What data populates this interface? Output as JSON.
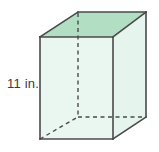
{
  "figure": {
    "name": "rectangular-prism",
    "type": "3d-solid-diagram",
    "background_color": "#ffffff",
    "colors": {
      "top_face": "#b2dfc4",
      "front_face": "#eaf6f0",
      "side_face": "#e6f4ee",
      "edge_solid": "#4a4a4a",
      "edge_hidden": "#4a4a4a",
      "label_text": "#3a3a3a"
    },
    "labels": [
      {
        "id": "height-label",
        "text": "11 in.",
        "value": 11,
        "unit": "in.",
        "measures": "height",
        "position": "left-of-front-left-edge"
      }
    ],
    "vertices": {
      "front_top_left": [
        40,
        37
      ],
      "front_top_right": [
        113,
        37
      ],
      "front_bottom_right": [
        113,
        139
      ],
      "front_bottom_left": [
        40,
        139
      ],
      "back_top_left": [
        78,
        12
      ],
      "back_top_right": [
        146,
        12
      ],
      "back_bottom_right": [
        146,
        117
      ],
      "back_bottom_left": [
        78,
        117
      ]
    },
    "hidden_edges": [
      "back_top_left-to-back_bottom_left",
      "back_bottom_left-to-back_bottom_right",
      "back_bottom_left-to-front_bottom_left"
    ]
  }
}
